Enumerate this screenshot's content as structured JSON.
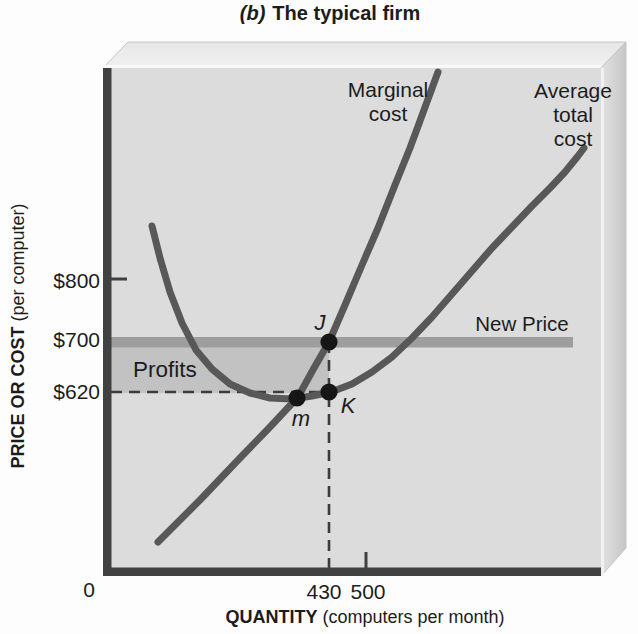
{
  "figure": {
    "title_prefix": "(b)",
    "title_text": "The typical firm"
  },
  "axes": {
    "y_title_bold": "PRICE OR COST",
    "y_title_normal": "(per computer)",
    "x_title_bold": "QUANTITY",
    "x_title_normal": "(computers per month)",
    "y_tick_800": "$800",
    "y_tick_700": "$700",
    "y_tick_620": "$620",
    "x_origin": "0",
    "x_tick_430": "430",
    "x_tick_500": "500"
  },
  "annotations": {
    "new_price": "New Price",
    "profits": "Profits",
    "point_j": "J",
    "point_k": "K",
    "point_m": "m",
    "mc_label_lines": [
      "Marginal",
      "cost"
    ],
    "atc_label_lines": [
      "Average",
      "total",
      "cost"
    ]
  },
  "chart_data": {
    "type": "line",
    "xlabel": "QUANTITY (computers per month)",
    "ylabel": "PRICE OR COST (per computer)",
    "x_tick_values": [
      0,
      430,
      500
    ],
    "y_tick_values": [
      620,
      700,
      800
    ],
    "grid": false,
    "legend_position": "none",
    "price_line": {
      "label": "New Price",
      "value": 700
    },
    "profit_region": {
      "label": "Profits",
      "q_from": 0,
      "q_to": 430,
      "value_from": 620,
      "value_to": 700
    },
    "points_of_interest": [
      {
        "label": "J",
        "q": 430,
        "value": 700,
        "px": [
          329,
          342
        ]
      },
      {
        "label": "K",
        "q": 430,
        "value": 620,
        "px": [
          329,
          392
        ]
      },
      {
        "label": "m",
        "q": 370,
        "value": 615,
        "px": [
          297,
          398
        ]
      }
    ],
    "dashed_guides": [
      {
        "type": "horizontal",
        "value": 620,
        "from_q": 0,
        "to_q": 430
      },
      {
        "type": "vertical",
        "q": 430,
        "from_value": 700,
        "to_value": "x-axis"
      }
    ],
    "series": [
      {
        "id": "mc",
        "name": "Marginal cost",
        "color": "#585858",
        "px_points": [
          [
            158,
            542
          ],
          [
            200,
            500
          ],
          [
            240,
            458
          ],
          [
            270,
            427
          ],
          [
            284,
            412
          ],
          [
            298,
            397
          ],
          [
            314,
            368
          ],
          [
            329,
            342
          ],
          [
            345,
            305
          ],
          [
            362,
            265
          ],
          [
            378,
            228
          ],
          [
            395,
            185
          ],
          [
            410,
            148
          ],
          [
            424,
            110
          ],
          [
            438,
            72
          ]
        ],
        "approx_points_q_value": [
          [
            98,
            378
          ],
          [
            180,
            446
          ],
          [
            256,
            513
          ],
          [
            340,
            585
          ],
          [
            370,
            615
          ],
          [
            430,
            700
          ],
          [
            460,
            758
          ],
          [
            520,
            880
          ],
          [
            555,
            950
          ],
          [
            610,
            1070
          ],
          [
            638,
            1130
          ]
        ]
      },
      {
        "id": "atc",
        "name": "Average total cost",
        "color": "#585858",
        "px_points": [
          [
            152,
            226
          ],
          [
            160,
            258
          ],
          [
            170,
            292
          ],
          [
            182,
            323
          ],
          [
            196,
            350
          ],
          [
            212,
            369
          ],
          [
            230,
            384
          ],
          [
            250,
            393
          ],
          [
            270,
            398
          ],
          [
            292,
            399
          ],
          [
            312,
            396
          ],
          [
            331,
            392
          ],
          [
            352,
            384
          ],
          [
            372,
            372
          ],
          [
            392,
            357
          ],
          [
            412,
            338
          ],
          [
            432,
            317
          ],
          [
            452,
            294
          ],
          [
            472,
            271
          ],
          [
            492,
            248
          ],
          [
            512,
            227
          ],
          [
            532,
            206
          ],
          [
            550,
            188
          ],
          [
            565,
            172
          ],
          [
            578,
            156
          ],
          [
            584,
            148
          ]
        ],
        "approx_points_q_value": [
          [
            87,
            884
          ],
          [
            172,
            686
          ],
          [
            237,
            631
          ],
          [
            314,
            609
          ],
          [
            357,
            607
          ],
          [
            395,
            612
          ],
          [
            430,
            620
          ],
          [
            511,
            650
          ],
          [
            588,
            705
          ],
          [
            665,
            775
          ],
          [
            742,
            849
          ],
          [
            820,
            916
          ],
          [
            883,
            970
          ],
          [
            920,
            1009
          ]
        ]
      }
    ]
  },
  "colors": {
    "front_face": "#dcdcdc",
    "top_face": "#ececec",
    "right_face": "#cfcfcf",
    "axis": "#414141",
    "curve": "#585858",
    "price_line": "#9e9e9e",
    "profit_fill": "#c2c2c2",
    "dashed": "#3c3c3c",
    "dot": "#161616",
    "text": "#1c1c1c"
  }
}
